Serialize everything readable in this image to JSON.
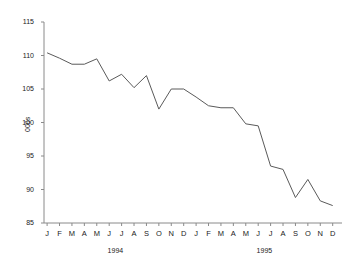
{
  "chart_data": {
    "type": "line",
    "title": "",
    "xlabel": "",
    "ylabel": "000s",
    "ylim": [
      85,
      115
    ],
    "yticks": [
      85,
      90,
      95,
      100,
      105,
      110,
      115
    ],
    "ytick_labels": [
      "85",
      "90",
      "95",
      "100",
      "105",
      "110",
      "115"
    ],
    "grid": false,
    "legend": "none",
    "line_color": "#5a5a5a",
    "axis_color": "#8a8a8a",
    "x": [
      "1994-01",
      "1994-02",
      "1994-03",
      "1994-04",
      "1994-05",
      "1994-06",
      "1994-07",
      "1994-08",
      "1994-09",
      "1994-10",
      "1994-11",
      "1994-12",
      "1995-01",
      "1995-02",
      "1995-03",
      "1995-04",
      "1995-05",
      "1995-06",
      "1995-07",
      "1995-08",
      "1995-09",
      "1995-10",
      "1995-11",
      "1995-12"
    ],
    "xtick_labels": [
      "J",
      "F",
      "M",
      "A",
      "M",
      "J",
      "J",
      "A",
      "S",
      "O",
      "N",
      "D",
      "J",
      "F",
      "M",
      "A",
      "M",
      "J",
      "J",
      "A",
      "S",
      "O",
      "N",
      "D"
    ],
    "group_labels": [
      "1994",
      "1995"
    ],
    "values": [
      110.4,
      109.6,
      108.7,
      108.7,
      109.5,
      106.2,
      107.2,
      105.2,
      107.0,
      102.0,
      105.0,
      105.0,
      103.8,
      102.5,
      102.2,
      102.2,
      99.8,
      99.5,
      93.5,
      93.0,
      88.8,
      91.5,
      88.3,
      87.6
    ]
  }
}
